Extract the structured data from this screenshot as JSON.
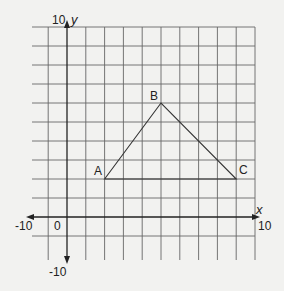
{
  "diagram": {
    "type": "coordinate-grid",
    "axes": {
      "x_label": "x",
      "y_label": "y",
      "x_max_label": "10",
      "x_min_label": "-10",
      "y_max_label": "10",
      "y_min_label": "-10",
      "origin_label": "0"
    },
    "grid": {
      "x_range_visible": [
        -2,
        10
      ],
      "y_range_visible": [
        -2,
        10
      ],
      "unit": 1
    },
    "triangle": {
      "vertices": [
        {
          "label": "A",
          "x": 2,
          "y": 2
        },
        {
          "label": "B",
          "x": 5,
          "y": 6
        },
        {
          "label": "C",
          "x": 9,
          "y": 2
        }
      ]
    },
    "colors": {
      "background": "#f2f2f0",
      "grid_line": "#555555",
      "axis": "#222222",
      "shape": "#333333",
      "text": "#222222"
    }
  }
}
